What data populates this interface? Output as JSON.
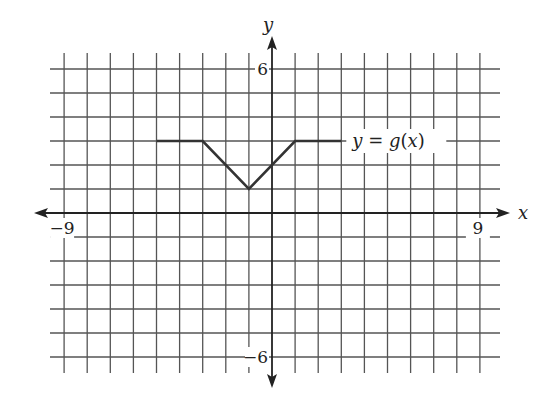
{
  "chart_data": {
    "type": "line",
    "title": "",
    "xlabel": "x",
    "ylabel": "y",
    "xlim": [
      -9,
      9
    ],
    "ylim": [
      -6,
      6
    ],
    "grid": true,
    "x_tick_labels": [
      {
        "value": -9,
        "label": "−9"
      },
      {
        "value": 9,
        "label": "9"
      }
    ],
    "y_tick_labels": [
      {
        "value": 6,
        "label": "6"
      },
      {
        "value": -6,
        "label": "−6"
      }
    ],
    "series": [
      {
        "name": "y = g(x)",
        "label": "y = g(x)",
        "points": [
          [
            -5,
            3
          ],
          [
            -3,
            3
          ],
          [
            -1,
            1
          ],
          [
            1,
            3
          ],
          [
            3,
            3
          ]
        ]
      }
    ],
    "annotations": [
      {
        "text": "y = g(x)",
        "x": 3.2,
        "y": 3
      }
    ],
    "colors": {
      "grid": "#555555",
      "axis": "#222222",
      "curve": "#333333"
    }
  }
}
